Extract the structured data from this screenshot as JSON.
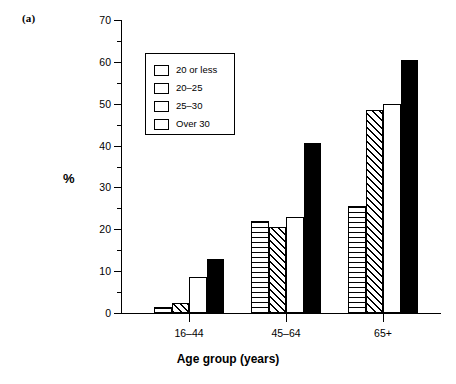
{
  "panel_label": "(a)",
  "legend": {
    "entries": [
      {
        "label": "20 or less",
        "pattern": "horizontal-lines"
      },
      {
        "label": "20–25",
        "pattern": "diagonal-hatch"
      },
      {
        "label": "25–30",
        "pattern": "white"
      },
      {
        "label": "Over 30",
        "pattern": "solid-black"
      }
    ]
  },
  "chart_data": {
    "type": "bar",
    "title": "",
    "subtitle": "",
    "panel": "(a)",
    "categories": [
      "16–44",
      "45–64",
      "65+"
    ],
    "series": [
      {
        "name": "20 or less",
        "values": [
          1.5,
          22.0,
          25.5
        ],
        "pattern": "horizontal-lines"
      },
      {
        "name": "20–25",
        "values": [
          2.5,
          20.5,
          48.5
        ],
        "pattern": "diagonal-hatch"
      },
      {
        "name": "25–30",
        "values": [
          8.5,
          23.0,
          50.0
        ],
        "pattern": "white"
      },
      {
        "name": "Over 30",
        "values": [
          13.0,
          40.5,
          60.5
        ],
        "pattern": "solid-black"
      }
    ],
    "xlabel": "Age group (years)",
    "ylabel": "%",
    "ylim": [
      0,
      70
    ],
    "ytick_major": [
      0,
      10,
      20,
      30,
      40,
      50,
      60,
      70
    ],
    "ytick_minor": [
      5,
      15,
      25,
      35,
      45,
      55,
      65
    ],
    "ytick_labels": [
      "0",
      "10",
      "20",
      "30",
      "40",
      "50",
      "60",
      "70"
    ],
    "grid": false,
    "legend_position": "upper-left-inside",
    "colors": {
      "ink": "#000000",
      "background": "#ffffff"
    }
  }
}
